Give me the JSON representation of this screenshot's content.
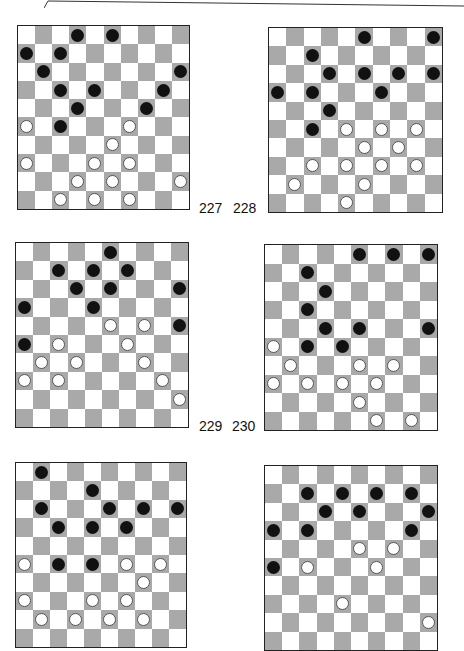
{
  "page": {
    "colors": {
      "dark_square": "#a9a9a9",
      "light_square": "#ffffff",
      "black_piece": "#111111",
      "white_piece": "#ffffff",
      "border": "#222222"
    }
  },
  "diagrams": [
    {
      "number": "227",
      "black": [
        [
          0,
          3
        ],
        [
          0,
          5
        ],
        [
          1,
          0
        ],
        [
          1,
          2
        ],
        [
          2,
          1
        ],
        [
          2,
          9
        ],
        [
          3,
          2
        ],
        [
          3,
          4
        ],
        [
          3,
          8
        ],
        [
          4,
          3
        ],
        [
          4,
          7
        ],
        [
          5,
          2
        ]
      ],
      "white": [
        [
          5,
          0
        ],
        [
          5,
          6
        ],
        [
          6,
          5
        ],
        [
          7,
          0
        ],
        [
          7,
          4
        ],
        [
          7,
          6
        ],
        [
          8,
          3
        ],
        [
          8,
          5
        ],
        [
          8,
          9
        ],
        [
          9,
          2
        ],
        [
          9,
          4
        ],
        [
          9,
          6
        ]
      ]
    },
    {
      "number": "228",
      "black": [
        [
          0,
          5
        ],
        [
          0,
          9
        ],
        [
          1,
          2
        ],
        [
          2,
          3
        ],
        [
          2,
          5
        ],
        [
          2,
          7
        ],
        [
          2,
          9
        ],
        [
          3,
          0
        ],
        [
          3,
          2
        ],
        [
          3,
          6
        ],
        [
          4,
          3
        ],
        [
          5,
          2
        ]
      ],
      "white": [
        [
          5,
          4
        ],
        [
          5,
          6
        ],
        [
          5,
          8
        ],
        [
          6,
          5
        ],
        [
          6,
          7
        ],
        [
          7,
          2
        ],
        [
          7,
          4
        ],
        [
          7,
          6
        ],
        [
          7,
          8
        ],
        [
          8,
          1
        ],
        [
          8,
          5
        ],
        [
          9,
          4
        ]
      ]
    },
    {
      "number": "229",
      "black": [
        [
          0,
          5
        ],
        [
          1,
          2
        ],
        [
          1,
          4
        ],
        [
          1,
          6
        ],
        [
          2,
          3
        ],
        [
          2,
          5
        ],
        [
          2,
          9
        ],
        [
          3,
          0
        ],
        [
          3,
          4
        ],
        [
          4,
          9
        ],
        [
          5,
          0
        ]
      ],
      "white": [
        [
          4,
          5
        ],
        [
          4,
          7
        ],
        [
          5,
          2
        ],
        [
          5,
          6
        ],
        [
          6,
          1
        ],
        [
          6,
          3
        ],
        [
          6,
          7
        ],
        [
          7,
          0
        ],
        [
          7,
          2
        ],
        [
          7,
          8
        ],
        [
          8,
          9
        ]
      ]
    },
    {
      "number": "230",
      "black": [
        [
          0,
          5
        ],
        [
          0,
          7
        ],
        [
          0,
          9
        ],
        [
          1,
          2
        ],
        [
          2,
          3
        ],
        [
          3,
          2
        ],
        [
          4,
          3
        ],
        [
          4,
          5
        ],
        [
          4,
          9
        ],
        [
          5,
          2
        ],
        [
          5,
          4
        ]
      ],
      "white": [
        [
          5,
          0
        ],
        [
          6,
          1
        ],
        [
          6,
          5
        ],
        [
          6,
          7
        ],
        [
          7,
          0
        ],
        [
          7,
          2
        ],
        [
          7,
          4
        ],
        [
          7,
          6
        ],
        [
          8,
          5
        ],
        [
          9,
          6
        ],
        [
          9,
          8
        ]
      ]
    },
    {
      "number": "231",
      "black": [
        [
          0,
          1
        ],
        [
          1,
          4
        ],
        [
          2,
          1
        ],
        [
          2,
          5
        ],
        [
          2,
          7
        ],
        [
          2,
          9
        ],
        [
          3,
          2
        ],
        [
          3,
          4
        ],
        [
          3,
          6
        ],
        [
          5,
          2
        ],
        [
          5,
          4
        ]
      ],
      "white": [
        [
          5,
          0
        ],
        [
          5,
          6
        ],
        [
          5,
          8
        ],
        [
          6,
          7
        ],
        [
          7,
          0
        ],
        [
          7,
          4
        ],
        [
          7,
          6
        ],
        [
          8,
          1
        ],
        [
          8,
          3
        ],
        [
          8,
          5
        ],
        [
          8,
          7
        ]
      ]
    },
    {
      "number": "232",
      "black": [
        [
          1,
          2
        ],
        [
          1,
          4
        ],
        [
          1,
          6
        ],
        [
          1,
          8
        ],
        [
          2,
          3
        ],
        [
          2,
          5
        ],
        [
          2,
          9
        ],
        [
          3,
          0
        ],
        [
          3,
          2
        ],
        [
          3,
          8
        ],
        [
          5,
          0
        ]
      ],
      "white": [
        [
          4,
          5
        ],
        [
          4,
          7
        ],
        [
          5,
          2
        ],
        [
          5,
          6
        ],
        [
          7,
          4
        ],
        [
          8,
          9
        ]
      ]
    }
  ]
}
